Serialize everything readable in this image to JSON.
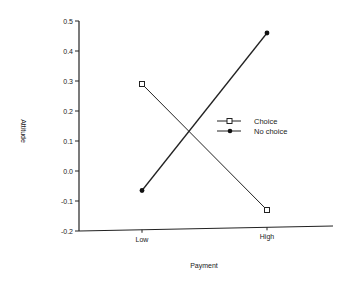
{
  "chart_data": {
    "type": "line",
    "title": "",
    "xlabel": "Payment",
    "ylabel": "Attitude",
    "categories": [
      "Low",
      "High"
    ],
    "series": [
      {
        "name": "Choice",
        "marker": "open-square",
        "values": [
          0.29,
          -0.13
        ]
      },
      {
        "name": "No choice",
        "marker": "filled-circle",
        "values": [
          -0.065,
          0.46
        ]
      }
    ],
    "ylim": [
      -0.2,
      0.5
    ],
    "yticks": [
      "0.5",
      "0.4",
      "0.3",
      "0.2",
      "0.1",
      "0.0",
      "-0.1",
      "-0.2"
    ],
    "grid": false,
    "legend_position": "center-right"
  }
}
